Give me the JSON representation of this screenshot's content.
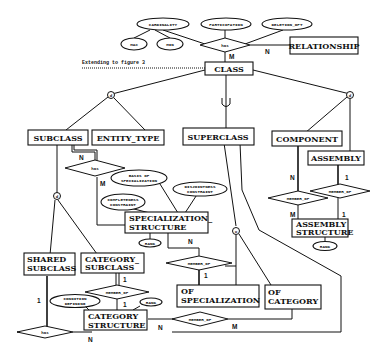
{
  "diagram": {
    "note": "Extending to figure 3",
    "entities": {
      "relationship": "RELATIONSHIP",
      "class": "CLASS",
      "subclass": "SUBCLASS",
      "entity_type": "ENTITY_TYPE",
      "superclass": "SUPERCLASS",
      "component": "COMPONENT",
      "assembly": "ASSEMBLY",
      "assembly_structure_1": "ASSEMBLY",
      "assembly_structure_2": "STRUCTURE",
      "specialization_structure_1": "SPECIALIZATION_",
      "specialization_structure_2": "STRUCTURE",
      "shared_subclass_1": "SHARED",
      "shared_subclass_2": "SUBCLASS",
      "category_subclass_1": "CATEGORY_",
      "category_subclass_2": "SUBCLASS",
      "category_structure_1": "CATEGORY",
      "category_structure_2": "STRUCTURE",
      "of_specialization_1": "OF",
      "of_specialization_2": "SPECIALIZATION",
      "of_category_1": "OF",
      "of_category_2": "CATEGORY"
    },
    "attributes": {
      "cardinality": "CARDINALITY",
      "participation": "PARTICIPATION",
      "deletion_opt": "DELETION_OPT",
      "max": "MAX",
      "min": "MIN",
      "basis_1": "BASIS OF",
      "basis_2": "SPECIALIZATION",
      "disjointness_1": "DISJOINTNESS",
      "disjointness_2": "CONSTRAINT",
      "completeness_1": "COMPLETENESS",
      "completeness_2": "CONSTRAINT",
      "rank_spec": "RANK",
      "rank_assembly": "RANK",
      "rank_category": "RANK",
      "condition_1": "CONDITION",
      "condition_2": "DEFINING"
    },
    "relationships": {
      "has_top": "has",
      "has_spec": "has",
      "has_bottom": "has",
      "member_of_comp": "MEMBER_OF",
      "member_of_assembly": "MEMBER_OF",
      "member_of_spec": "MEMBER_OF",
      "member_of_catsub": "MEMBER_OF",
      "member_of_catstruct": "MEMBER_OF"
    },
    "constraints": {
      "disjoint_left": "d",
      "disjoint_right": "d",
      "overlap_shared": "d",
      "overlap_super": "o",
      "union_symbol": "U"
    },
    "cardinalities": {
      "has_top_class": "M",
      "has_top_rel": "N",
      "has_spec_subclass": "N",
      "has_spec_struct": "M",
      "comp_n": "N",
      "comp_m": "M",
      "assembly_1": "1",
      "assembly_struct_1": "1",
      "spec_n": "N",
      "spec_1": "1",
      "catsub_1": "1",
      "catstruct_1": "1",
      "shared_1": "1",
      "bottom_n": "N",
      "catstruct_n": "N",
      "catstruct_m": "M"
    }
  }
}
